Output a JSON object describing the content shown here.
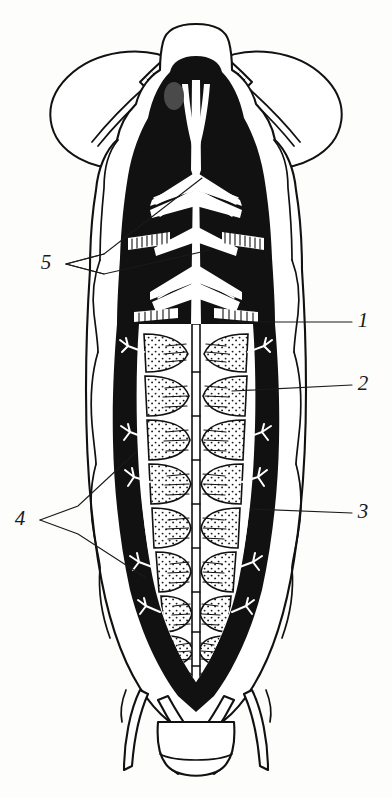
{
  "figure": {
    "kind": "anatomical-illustration",
    "view": "dorsal",
    "background_color": "#fdfdfb",
    "ink_color": "#111111",
    "fill_color": "#ffffff",
    "labels": [
      {
        "id": "label-1",
        "text": "1",
        "x": 363,
        "y": 322,
        "side": "right"
      },
      {
        "id": "label-2",
        "text": "2",
        "x": 363,
        "y": 385,
        "side": "right"
      },
      {
        "id": "label-3",
        "text": "3",
        "x": 363,
        "y": 513,
        "side": "right"
      },
      {
        "id": "label-4",
        "text": "4",
        "x": 20,
        "y": 520,
        "side": "left"
      },
      {
        "id": "label-5",
        "text": "5",
        "x": 46,
        "y": 264,
        "side": "left"
      }
    ],
    "parts": {
      "head": "head-capsule",
      "antennae": "segmented-antennae",
      "wings": "membranous-wing-pair",
      "thorax": "thorax-dark-region",
      "abdomen": "abdominal-segments-stippled",
      "nerve_cord": "median-longitudinal-cord",
      "tracheae": "lateral-tracheal-branches",
      "legs": "crossed-leg-pair",
      "terminal": "terminal-abdominal-segment"
    },
    "segment_count": 9,
    "tracheal_branch_count": 8
  }
}
